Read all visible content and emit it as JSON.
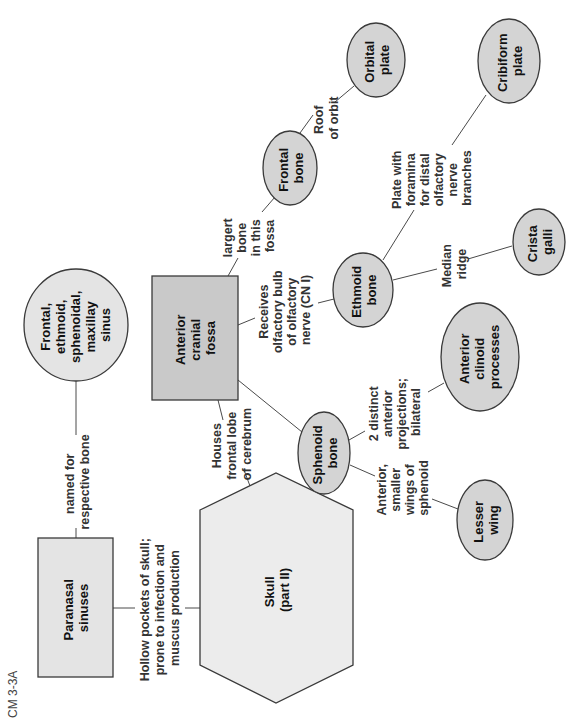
{
  "figure_label": "CM 3-3A",
  "nodes": {
    "skull": {
      "lines": [
        "Skull",
        "(part II)"
      ]
    },
    "paranasal_sinuses": {
      "lines": [
        "Paranasal",
        "sinuses"
      ]
    },
    "sinus_types": {
      "lines": [
        "Frontal,",
        "ethmoid,",
        "sphenoidal,",
        "maxillay",
        "sinus"
      ]
    },
    "anterior_cranial_fossa": {
      "lines": [
        "Anterior",
        "cranial",
        "fossa"
      ]
    },
    "frontal_bone": {
      "lines": [
        "Frontal",
        "bone"
      ]
    },
    "orbital_plate": {
      "lines": [
        "Orbital",
        "plate"
      ]
    },
    "ethmoid_bone": {
      "lines": [
        "Ethmoid",
        "bone"
      ]
    },
    "cribiform_plate": {
      "lines": [
        "Cribiform",
        "plate"
      ]
    },
    "crista_galli": {
      "lines": [
        "Crista",
        "galli"
      ]
    },
    "sphenoid_bone": {
      "lines": [
        "Sphenoid",
        "bone"
      ]
    },
    "anterior_clinoid": {
      "lines": [
        "Anterior",
        "clinoid",
        "processes"
      ]
    },
    "lesser_wing": {
      "lines": [
        "Lesser",
        "wing"
      ]
    }
  },
  "edges": {
    "skull_to_paranasal": {
      "lines": [
        "Hollow pockets of skull;",
        "prone to infection and",
        "muscus production"
      ]
    },
    "paranasal_to_types": {
      "lines": [
        "named for",
        "respective bone"
      ]
    },
    "skull_to_fossa": {
      "lines": [
        "Houses",
        "frontal lobe",
        "of cerebrum"
      ]
    },
    "fossa_to_frontal": {
      "lines": [
        "largert",
        "bone",
        "in this",
        "fossa"
      ]
    },
    "frontal_to_orbital": {
      "lines": [
        "Roof",
        "of orbit"
      ]
    },
    "fossa_to_ethmoid": {
      "lines": [
        "Receives",
        "olfactory bulb",
        "of olfactory",
        "nerve (CN I)"
      ]
    },
    "ethmoid_to_cribiform": {
      "lines": [
        "Plate with",
        "foramina",
        "for distal",
        "olfactory",
        "nerve",
        "branches"
      ]
    },
    "ethmoid_to_crista": {
      "lines": [
        "Median",
        "ridge"
      ]
    },
    "sphenoid_to_clinoid": {
      "lines": [
        "2 distinct",
        "anterior",
        "projections;",
        "bilateral"
      ]
    },
    "sphenoid_to_lesser": {
      "lines": [
        "Anterior,",
        "smaller",
        "wings of",
        "sphenoid"
      ]
    }
  }
}
